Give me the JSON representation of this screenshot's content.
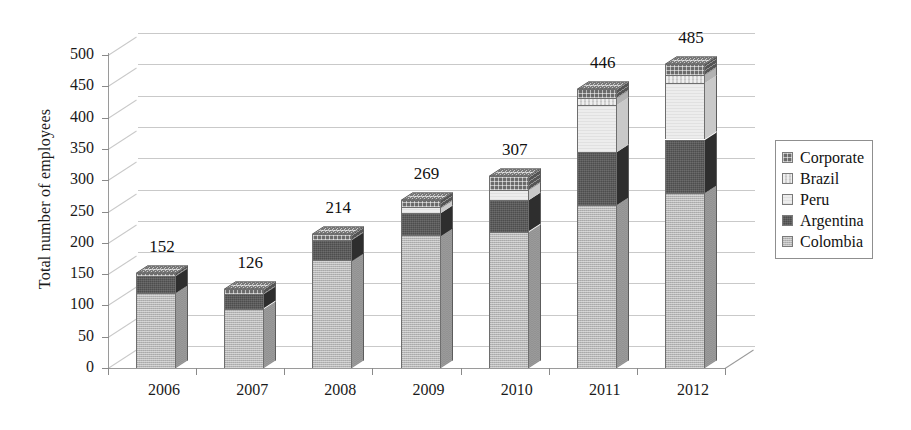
{
  "chart_data": {
    "type": "bar",
    "subtype": "stacked-column-3d",
    "title": "",
    "xlabel": "",
    "ylabel": "Total number of employees",
    "categories": [
      "2006",
      "2007",
      "2008",
      "2009",
      "2010",
      "2011",
      "2012"
    ],
    "ylim": [
      0,
      500
    ],
    "yticks": [
      0,
      50,
      100,
      150,
      200,
      250,
      300,
      350,
      400,
      450,
      500
    ],
    "ytick_labels": [
      "0",
      "50",
      "100",
      "150",
      "200",
      "250",
      "300",
      "350",
      "400",
      "450",
      "500"
    ],
    "grid": true,
    "legend_position": "right",
    "series": [
      {
        "name": "Colombia",
        "color": "#b6b6b6",
        "values": [
          120,
          95,
          172,
          212,
          218,
          260,
          280
        ]
      },
      {
        "name": "Argentina",
        "color": "#4d4d4d",
        "values": [
          27,
          23,
          33,
          36,
          50,
          85,
          85
        ]
      },
      {
        "name": "Peru",
        "color": "#ededed",
        "values": [
          0,
          0,
          0,
          9,
          16,
          75,
          90
        ]
      },
      {
        "name": "Brazil",
        "color": "#d2d2d2",
        "values": [
          0,
          0,
          0,
          0,
          0,
          11,
          13
        ]
      },
      {
        "name": "Corporate",
        "color": "#6b6b6b",
        "values": [
          5,
          8,
          9,
          12,
          23,
          15,
          17
        ]
      }
    ],
    "totals": [
      152,
      126,
      214,
      269,
      307,
      446,
      485
    ],
    "total_labels": [
      "152",
      "126",
      "214",
      "269",
      "307",
      "446",
      "485"
    ]
  },
  "legend": {
    "items": [
      {
        "label": "Corporate"
      },
      {
        "label": "Brazil"
      },
      {
        "label": "Peru"
      },
      {
        "label": "Argentina"
      },
      {
        "label": "Colombia"
      }
    ]
  }
}
